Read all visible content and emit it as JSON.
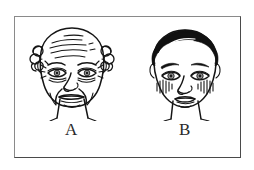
{
  "figure": {
    "caption_a": "A",
    "caption_b": "B",
    "title": "",
    "frame_color": "#8a8a8a",
    "ink_color": "#151515",
    "background_color": "#ffffff"
  },
  "panels": [
    {
      "id": "A",
      "label": "A",
      "subject": "elderly-face",
      "description": "Line drawing of an aged human face, front view",
      "features": [
        "forehead-wrinkles",
        "crows-feet",
        "drooping-eyelids",
        "nasolabial-folds",
        "thin-lips",
        "sagging-jowls",
        "curly-side-hair-tufts",
        "bald-crown",
        "neck-lines"
      ],
      "hair_style": "sparse-curly-sides",
      "hair_fill": "outline"
    },
    {
      "id": "B",
      "label": "B",
      "subject": "young-face",
      "description": "Line drawing of a young human face, front view",
      "features": [
        "full-dark-hair",
        "smooth-forehead",
        "thick-eyebrows",
        "open-eyes",
        "hatched-cheek-blush",
        "full-lips",
        "smooth-jawline",
        "neck"
      ],
      "hair_style": "full-dark-swept",
      "hair_fill": "solid-black"
    }
  ]
}
